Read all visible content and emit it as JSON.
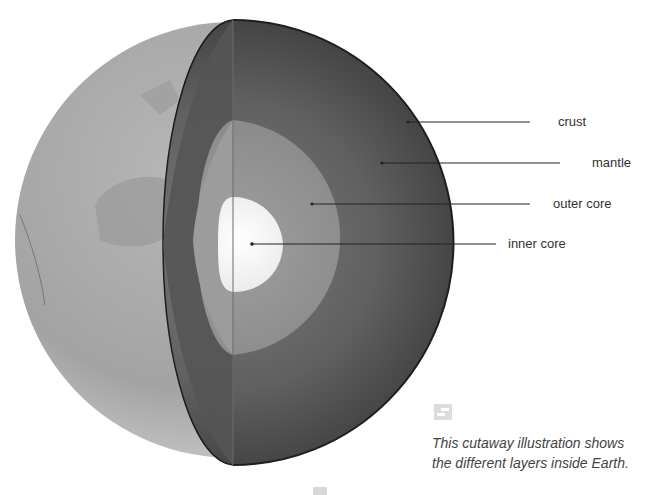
{
  "diagram": {
    "colors": {
      "background": "#ffffff",
      "surface": "#a9a9a9",
      "mantle": "#5e5e5e",
      "outer_core": "#8a8a8a",
      "inner_core": "#f4f4f4",
      "leader_line": "#222222",
      "label_text": "#333333"
    },
    "labels": [
      {
        "id": "crust",
        "text": "crust"
      },
      {
        "id": "mantle",
        "text": "mantle"
      },
      {
        "id": "outer-core",
        "text": "outer core"
      },
      {
        "id": "inner-core",
        "text": "inner core"
      }
    ]
  },
  "caption": {
    "icon": "expand-icon",
    "line1": "This cutaway illustration shows",
    "line2": "the different layers inside Earth."
  }
}
